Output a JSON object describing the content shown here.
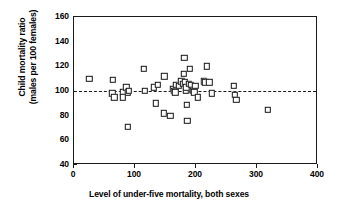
{
  "chart_data": {
    "type": "scatter",
    "title": "",
    "xlabel": "Level of under-five mortality, both sexes",
    "ylabel": "Child mortality ratio\n(males per 100 females)",
    "ylabel_line1": "Child mortality ratio",
    "ylabel_line2": "(males per 100 females)",
    "xlim": [
      0,
      400
    ],
    "ylim": [
      40,
      160
    ],
    "xticks": [
      0,
      100,
      200,
      300,
      400
    ],
    "yticks": [
      40,
      60,
      80,
      100,
      120,
      140,
      160
    ],
    "xtick_labels": [
      "0",
      "100",
      "200",
      "300",
      "400"
    ],
    "ytick_labels": [
      "40",
      "60",
      "80",
      "100",
      "120",
      "140",
      "160"
    ],
    "grid": false,
    "legend": false,
    "marker": "open-square",
    "marker_color": "#141414",
    "reference_lines": [
      {
        "axis": "y",
        "value": 100,
        "style": "dashed",
        "color": "#1a1a1a"
      }
    ],
    "points": [
      {
        "x": 25,
        "y": 110
      },
      {
        "x": 64,
        "y": 109
      },
      {
        "x": 63,
        "y": 98
      },
      {
        "x": 66,
        "y": 95
      },
      {
        "x": 80,
        "y": 99
      },
      {
        "x": 80,
        "y": 95
      },
      {
        "x": 86,
        "y": 103
      },
      {
        "x": 88,
        "y": 99
      },
      {
        "x": 90,
        "y": 100
      },
      {
        "x": 88,
        "y": 71
      },
      {
        "x": 114,
        "y": 118
      },
      {
        "x": 116,
        "y": 100
      },
      {
        "x": 131,
        "y": 103
      },
      {
        "x": 134,
        "y": 90
      },
      {
        "x": 137,
        "y": 105
      },
      {
        "x": 148,
        "y": 112
      },
      {
        "x": 147,
        "y": 82
      },
      {
        "x": 158,
        "y": 80
      },
      {
        "x": 162,
        "y": 102
      },
      {
        "x": 164,
        "y": 100
      },
      {
        "x": 166,
        "y": 99
      },
      {
        "x": 168,
        "y": 105
      },
      {
        "x": 172,
        "y": 104
      },
      {
        "x": 176,
        "y": 108
      },
      {
        "x": 178,
        "y": 106
      },
      {
        "x": 180,
        "y": 114
      },
      {
        "x": 181,
        "y": 127
      },
      {
        "x": 182,
        "y": 107
      },
      {
        "x": 183,
        "y": 100
      },
      {
        "x": 184,
        "y": 103
      },
      {
        "x": 185,
        "y": 89
      },
      {
        "x": 186,
        "y": 76
      },
      {
        "x": 188,
        "y": 106
      },
      {
        "x": 190,
        "y": 118
      },
      {
        "x": 191,
        "y": 105
      },
      {
        "x": 193,
        "y": 101
      },
      {
        "x": 195,
        "y": 100
      },
      {
        "x": 197,
        "y": 99
      },
      {
        "x": 199,
        "y": 104
      },
      {
        "x": 203,
        "y": 95
      },
      {
        "x": 213,
        "y": 108
      },
      {
        "x": 215,
        "y": 107
      },
      {
        "x": 218,
        "y": 120
      },
      {
        "x": 222,
        "y": 107
      },
      {
        "x": 226,
        "y": 98
      },
      {
        "x": 262,
        "y": 104
      },
      {
        "x": 264,
        "y": 97
      },
      {
        "x": 266,
        "y": 93
      },
      {
        "x": 318,
        "y": 85
      }
    ]
  }
}
